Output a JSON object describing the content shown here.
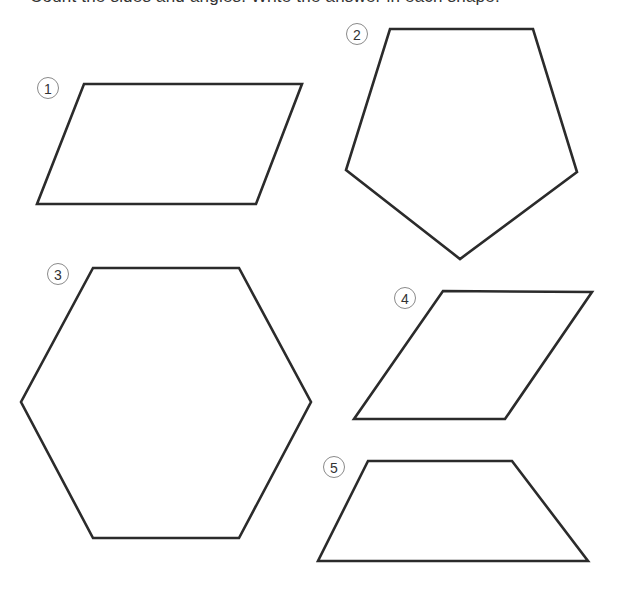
{
  "worksheet": {
    "instruction_text": "Count the sides and angles. Write the answer in each shape.",
    "stroke_color": "#2b2b2b",
    "label_circle_color": "#8a8a8a",
    "shapes": [
      {
        "number": "1",
        "type": "parallelogram",
        "label_center": [
          48,
          88
        ],
        "points": "84,84 302,84 256,204 37,204"
      },
      {
        "number": "2",
        "type": "pentagon",
        "label_center": [
          357,
          34
        ],
        "points": "390,29 533,29 577,172 460,259 346,170"
      },
      {
        "number": "3",
        "type": "hexagon",
        "label_center": [
          58,
          274
        ],
        "points": "93,268 239,268 311,402 239,538 93,538 21,402"
      },
      {
        "number": "4",
        "type": "rhombus",
        "label_center": [
          405,
          298
        ],
        "points": "443,291 592,292 505,419 354,419"
      },
      {
        "number": "5",
        "type": "trapezoid",
        "label_center": [
          334,
          467
        ],
        "points": "368,461 512,461 588,561 318,561"
      }
    ]
  }
}
